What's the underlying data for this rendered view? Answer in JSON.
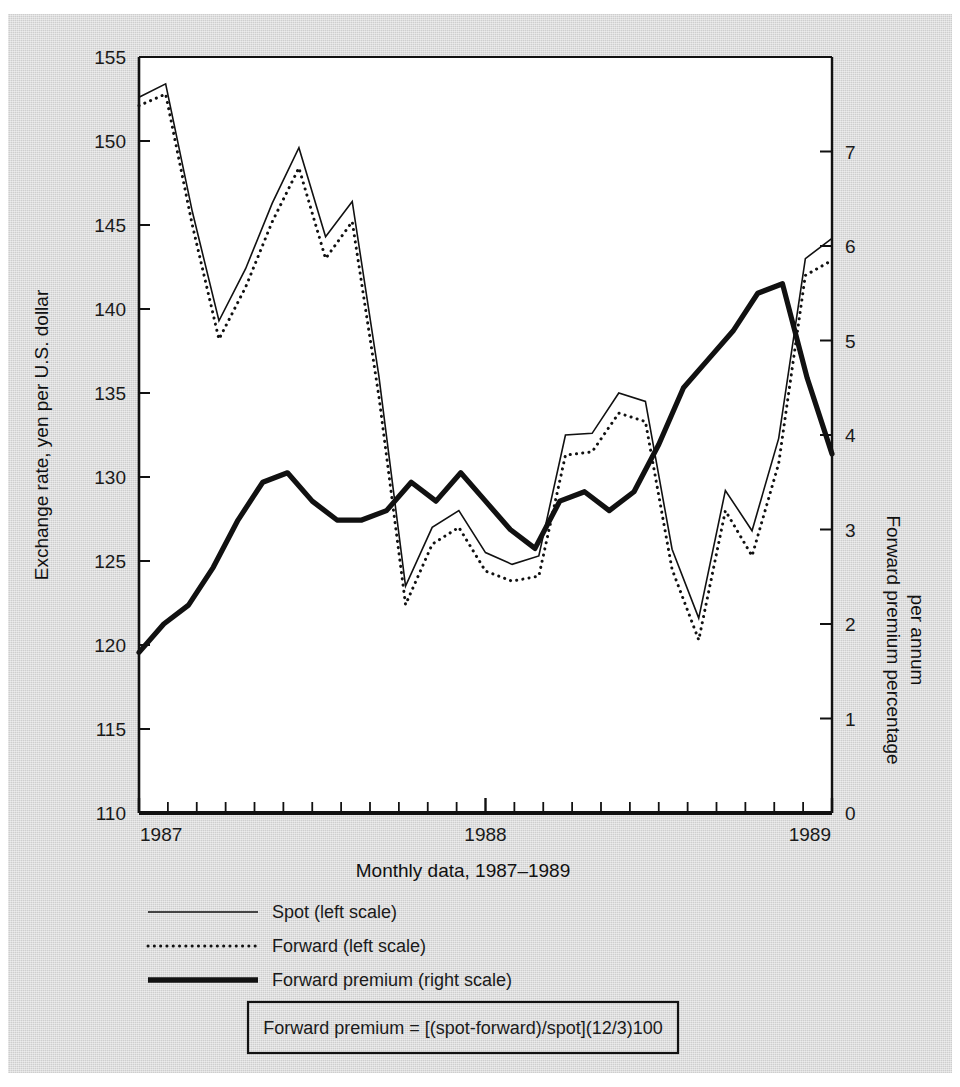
{
  "chart_data": {
    "type": "line",
    "title": "",
    "xlabel": "Monthly data, 1987–1989",
    "ylabel": "Exchange rate, yen per U.S. dollar",
    "y2label": "Forward premium percentage per annum",
    "ylim": [
      110,
      155
    ],
    "y2lim": [
      0,
      8
    ],
    "xlim": [
      0,
      24
    ],
    "grid": false,
    "legend_position": "below-axes-left",
    "y_ticks": [
      110,
      115,
      120,
      125,
      130,
      135,
      140,
      145,
      150,
      155
    ],
    "y_tick_labels": [
      "110",
      "115",
      "120",
      "125",
      "130",
      "135",
      "140",
      "145",
      "150",
      "155"
    ],
    "y2_ticks": [
      0,
      1,
      2,
      3,
      4,
      5,
      6,
      7
    ],
    "y2_tick_labels": [
      "0",
      "1",
      "2",
      "3",
      "4",
      "5",
      "6",
      "7"
    ],
    "x_ticks": [
      0,
      12,
      24
    ],
    "x_tick_labels": [
      "1987",
      "1988",
      "1989"
    ],
    "x_minor_tick_count": 25,
    "x": [
      0,
      1,
      2,
      3,
      4,
      5,
      6,
      7,
      8,
      9,
      10,
      11,
      12,
      13,
      14,
      15,
      16,
      17,
      18,
      19,
      20,
      21,
      22,
      23,
      24
    ],
    "series": [
      {
        "name": "Spot (left scale)",
        "axis": "left",
        "style": "solid-thin",
        "values": [
          152.6,
          153.4,
          145.8,
          139.3,
          142.4,
          146.3,
          149.6,
          144.3,
          146.4,
          136.0,
          123.5,
          127.0,
          128.0,
          125.5,
          124.8,
          125.3,
          132.5,
          132.6,
          135.0,
          134.5,
          125.7,
          121.6,
          129.2,
          126.8,
          132.3
        ]
      },
      {
        "name": "Forward (left scale)",
        "axis": "left",
        "style": "dotted-thin",
        "values": [
          152.1,
          152.8,
          145.0,
          138.2,
          141.3,
          145.2,
          148.4,
          143.0,
          145.2,
          134.8,
          122.4,
          126.0,
          127.0,
          124.4,
          123.8,
          124.1,
          131.3,
          131.5,
          133.8,
          133.3,
          124.5,
          120.3,
          128.0,
          125.3,
          130.8
        ]
      },
      {
        "name": "Forward premium (right scale)",
        "axis": "right",
        "style": "solid-thick",
        "values": [
          1.7,
          2.0,
          2.2,
          2.6,
          3.1,
          3.5,
          3.6,
          3.3,
          3.1,
          3.1,
          3.2,
          3.5,
          3.3,
          3.6,
          3.3,
          3.0,
          2.8,
          3.3,
          3.4,
          3.2,
          3.4,
          3.9,
          4.5,
          4.8,
          5.1
        ]
      }
    ],
    "extra_points": {
      "spot_tail": [
        143.0,
        144.2
      ],
      "forward_tail": [
        142.0,
        142.9
      ],
      "premium_tail": [
        5.5,
        5.6,
        4.6,
        3.8
      ]
    },
    "annotations": [
      "Forward premium = [(spot-forward)/spot](12/3)100"
    ]
  },
  "axes": {
    "left_title": "Exchange rate, yen per U.S. dollar",
    "right_title": "Forward premium percentage per annum",
    "x_title": "Monthly data, 1987–1989"
  },
  "legend": {
    "items": [
      {
        "label": "Spot (left scale)",
        "style": "solid-thin"
      },
      {
        "label": "Forward (left scale)",
        "style": "dotted-thin"
      },
      {
        "label": "Forward premium (right scale)",
        "style": "solid-thick"
      }
    ]
  },
  "formula_box": {
    "text": "Forward premium = [(spot-forward)/spot](12/3)100"
  },
  "colors": {
    "page_background": "#d6d6d6",
    "paper": "#ffffff",
    "plot_background": "#ffffff",
    "ink": "#111111"
  }
}
